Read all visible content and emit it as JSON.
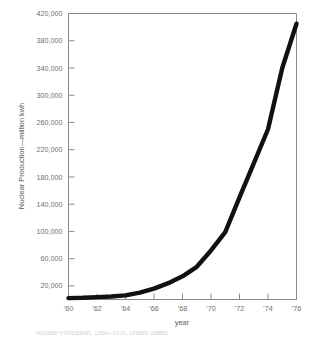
{
  "chart_data": {
    "type": "line",
    "title": "",
    "xlabel": "year",
    "ylabel": "Nuclear Production—million kwh",
    "xlim": [
      1960,
      1976
    ],
    "ylim": [
      0,
      420000
    ],
    "grid": false,
    "legend": null,
    "line_color": "#111111",
    "axis_color": "#8a8a8a",
    "text_color": "#6e6e6e",
    "background": "#ffffff",
    "x_tick_labels": [
      "'60",
      "'62",
      "'64",
      "'66",
      "'68",
      "'70",
      "'72",
      "'74",
      "'76"
    ],
    "x_tick_values": [
      1960,
      1962,
      1964,
      1966,
      1968,
      1970,
      1972,
      1974,
      1976
    ],
    "y_tick_labels": [
      "20,000",
      "60,000",
      "100,000",
      "140,000",
      "180,000",
      "220,000",
      "260,000",
      "300,000",
      "340,000",
      "380,000",
      "420,000"
    ],
    "y_tick_values": [
      20000,
      60000,
      100000,
      140000,
      180000,
      220000,
      260000,
      300000,
      340000,
      380000,
      420000
    ],
    "x": [
      1960,
      1961,
      1962,
      1963,
      1964,
      1965,
      1966,
      1967,
      1968,
      1969,
      1970,
      1971,
      1972,
      1973,
      1974,
      1975,
      1976
    ],
    "values": [
      2000,
      2500,
      3500,
      4500,
      6000,
      10000,
      16000,
      24000,
      34000,
      48000,
      72000,
      99000,
      150000,
      200000,
      250000,
      340000,
      405000
    ],
    "series": [
      {
        "name": "Nuclear Production",
        "values": [
          2000,
          2500,
          3500,
          4500,
          6000,
          10000,
          16000,
          24000,
          34000,
          48000,
          72000,
          99000,
          150000,
          200000,
          250000,
          340000,
          405000
        ]
      }
    ]
  },
  "caption": {
    "text": "Nuclear Production, 1960–1976, United States"
  }
}
